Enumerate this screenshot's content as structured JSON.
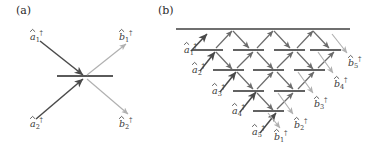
{
  "figure": {
    "kind": "beam-splitter-network-diagram",
    "width": 371,
    "height": 146,
    "background": "#ffffff"
  },
  "colors": {
    "input_arrow": "#4a4a4a",
    "output_arrow": "#b0b0b0",
    "internal_arrow": "#6b6b6b",
    "beamsplitter": "#5a5a5a",
    "mirror": "#6f6f6f",
    "text": "#3a3a3a",
    "panel_label_text": "#2b2b2b"
  },
  "panels": [
    {
      "id": "a",
      "label": "(a)",
      "label_x": 16,
      "label_y": 14,
      "description": "single two-port beam splitter",
      "beamsplitters": [
        {
          "id": "bs-a-1",
          "x1": 57,
          "y1": 76,
          "x2": 113,
          "y2": 76
        }
      ],
      "inputs": [
        {
          "name": "a1",
          "label_base": "a",
          "label_sub": "1",
          "label_dag": "†",
          "label_x": 30,
          "label_y": 40,
          "arrow": {
            "x1": 40,
            "y1": 41,
            "x2": 83,
            "y2": 75
          }
        },
        {
          "name": "a2",
          "label_base": "a",
          "label_sub": "2",
          "label_dag": "†",
          "label_x": 30,
          "label_y": 127,
          "arrow": {
            "x1": 36,
            "y1": 119,
            "x2": 83,
            "y2": 79
          }
        }
      ],
      "outputs": [
        {
          "name": "b1",
          "label_base": "b",
          "label_sub": "1",
          "label_dag": "†",
          "label_x": 119,
          "label_y": 40,
          "arrow": {
            "x1": 87,
            "y1": 75,
            "x2": 126,
            "y2": 44
          }
        },
        {
          "name": "b2",
          "label_base": "b",
          "label_sub": "2",
          "label_dag": "†",
          "label_x": 119,
          "label_y": 127,
          "arrow": {
            "x1": 87,
            "y1": 79,
            "x2": 128,
            "y2": 114
          }
        }
      ]
    },
    {
      "id": "b",
      "label": "(b)",
      "label_x": 158,
      "label_y": 14,
      "description": "cascaded staircase array of beam splitters with five inputs and five outputs",
      "mirror": {
        "x1": 176,
        "y1": 29,
        "x2": 350,
        "y2": 29
      },
      "beamsplitters": [
        {
          "id": "bs-b-r1c1",
          "x1": 192,
          "y1": 50,
          "x2": 223,
          "y2": 50
        },
        {
          "id": "bs-b-r1c2",
          "x1": 233,
          "y1": 50,
          "x2": 264,
          "y2": 50
        },
        {
          "id": "bs-b-r1c3",
          "x1": 274,
          "y1": 50,
          "x2": 305,
          "y2": 50
        },
        {
          "id": "bs-b-r1c4",
          "x1": 310,
          "y1": 50,
          "x2": 341,
          "y2": 50
        },
        {
          "id": "bs-b-r2c1",
          "x1": 213,
          "y1": 70,
          "x2": 244,
          "y2": 70
        },
        {
          "id": "bs-b-r2c2",
          "x1": 253,
          "y1": 70,
          "x2": 284,
          "y2": 70
        },
        {
          "id": "bs-b-r2c3",
          "x1": 294,
          "y1": 70,
          "x2": 325,
          "y2": 70
        },
        {
          "id": "bs-b-r3c1",
          "x1": 233,
          "y1": 91,
          "x2": 264,
          "y2": 91
        },
        {
          "id": "bs-b-r3c2",
          "x1": 274,
          "y1": 91,
          "x2": 305,
          "y2": 91
        },
        {
          "id": "bs-b-r4c1",
          "x1": 253,
          "y1": 111,
          "x2": 284,
          "y2": 111
        }
      ],
      "inputs": [
        {
          "name": "a1",
          "label_base": "a",
          "label_sub": "1",
          "label_dag": "†",
          "label_x": 184,
          "label_y": 53,
          "arrow": {
            "x1": 191,
            "y1": 51,
            "x2": 207,
            "y2": 34
          }
        },
        {
          "name": "a2",
          "label_base": "a",
          "label_sub": "2",
          "label_dag": "†",
          "label_x": 192,
          "label_y": 73,
          "arrow": {
            "x1": 200,
            "y1": 71,
            "x2": 215,
            "y2": 52
          }
        },
        {
          "name": "a3",
          "label_base": "a",
          "label_sub": "3",
          "label_dag": "†",
          "label_x": 212,
          "label_y": 94,
          "arrow": {
            "x1": 220,
            "y1": 92,
            "x2": 236,
            "y2": 72
          }
        },
        {
          "name": "a4",
          "label_base": "a",
          "label_sub": "4",
          "label_dag": "†",
          "label_x": 232,
          "label_y": 114,
          "arrow": {
            "x1": 240,
            "y1": 112,
            "x2": 256,
            "y2": 92
          }
        },
        {
          "name": "a5",
          "label_base": "a",
          "label_sub": "5",
          "label_dag": "†",
          "label_x": 252,
          "label_y": 135,
          "arrow": {
            "x1": 260,
            "y1": 133,
            "x2": 276,
            "y2": 113
          }
        }
      ],
      "outputs": [
        {
          "name": "b5",
          "label_base": "b",
          "label_sub": "5",
          "label_dag": "†",
          "label_x": 348,
          "label_y": 66,
          "arrow": {
            "x1": 332,
            "y1": 34,
            "x2": 347,
            "y2": 53
          }
        },
        {
          "name": "b4",
          "label_base": "b",
          "label_sub": "4",
          "label_dag": "†",
          "label_x": 334,
          "label_y": 87,
          "arrow": {
            "x1": 318,
            "y1": 52,
            "x2": 333,
            "y2": 73
          }
        },
        {
          "name": "b3",
          "label_base": "b",
          "label_sub": "3",
          "label_dag": "†",
          "label_x": 314,
          "label_y": 107,
          "arrow": {
            "x1": 298,
            "y1": 72,
            "x2": 313,
            "y2": 93
          }
        },
        {
          "name": "b2",
          "label_base": "b",
          "label_sub": "2",
          "label_dag": "†",
          "label_x": 294,
          "label_y": 128,
          "arrow": {
            "x1": 278,
            "y1": 93,
            "x2": 293,
            "y2": 114
          }
        },
        {
          "name": "b1",
          "label_base": "b",
          "label_sub": "1",
          "label_dag": "†",
          "label_x": 274,
          "label_y": 140,
          "arrow": {
            "x1": 268,
            "y1": 113,
            "x2": 280,
            "y2": 128
          }
        }
      ],
      "internal_links": [
        {
          "from": "bs-b-r1c1",
          "to": "mirror",
          "x1": 216,
          "y1": 48,
          "x2": 232,
          "y2": 31
        },
        {
          "from": "mirror",
          "to": "bs-b-r1c2",
          "x1": 233,
          "y1": 31,
          "x2": 249,
          "y2": 48
        },
        {
          "from": "bs-b-r1c2",
          "to": "mirror",
          "x1": 257,
          "y1": 48,
          "x2": 273,
          "y2": 31
        },
        {
          "from": "mirror",
          "to": "bs-b-r1c3",
          "x1": 274,
          "y1": 31,
          "x2": 290,
          "y2": 48
        },
        {
          "from": "bs-b-r1c3",
          "to": "mirror",
          "x1": 297,
          "y1": 48,
          "x2": 313,
          "y2": 31
        },
        {
          "from": "mirror",
          "to": "bs-b-r1c4",
          "x1": 313,
          "y1": 31,
          "x2": 329,
          "y2": 48
        },
        {
          "from": "bs-b-r1c1",
          "to": "bs-b-r2c1",
          "x1": 216,
          "y1": 52,
          "x2": 232,
          "y2": 69
        },
        {
          "from": "bs-b-r2c1",
          "to": "bs-b-r1c2",
          "x1": 237,
          "y1": 68,
          "x2": 253,
          "y2": 52
        },
        {
          "from": "bs-b-r1c2",
          "to": "bs-b-r2c2",
          "x1": 257,
          "y1": 52,
          "x2": 273,
          "y2": 69
        },
        {
          "from": "bs-b-r2c2",
          "to": "bs-b-r1c3",
          "x1": 277,
          "y1": 68,
          "x2": 293,
          "y2": 52
        },
        {
          "from": "bs-b-r1c3",
          "to": "bs-b-r2c3",
          "x1": 297,
          "y1": 52,
          "x2": 313,
          "y2": 69
        },
        {
          "from": "bs-b-r2c3",
          "to": "bs-b-r1c4",
          "x1": 318,
          "y1": 68,
          "x2": 334,
          "y2": 52
        },
        {
          "from": "bs-b-r2c1",
          "to": "bs-b-r3c1",
          "x1": 237,
          "y1": 72,
          "x2": 253,
          "y2": 89
        },
        {
          "from": "bs-b-r3c1",
          "to": "bs-b-r2c2",
          "x1": 257,
          "y1": 89,
          "x2": 273,
          "y2": 72
        },
        {
          "from": "bs-b-r2c2",
          "to": "bs-b-r3c2",
          "x1": 277,
          "y1": 72,
          "x2": 293,
          "y2": 89
        },
        {
          "from": "bs-b-r3c2",
          "to": "bs-b-r2c3",
          "x1": 298,
          "y1": 89,
          "x2": 314,
          "y2": 72
        },
        {
          "from": "bs-b-r3c1",
          "to": "bs-b-r4c1",
          "x1": 257,
          "y1": 93,
          "x2": 273,
          "y2": 110
        },
        {
          "from": "bs-b-r4c1",
          "to": "bs-b-r3c2",
          "x1": 277,
          "y1": 109,
          "x2": 293,
          "y2": 93
        }
      ]
    }
  ]
}
